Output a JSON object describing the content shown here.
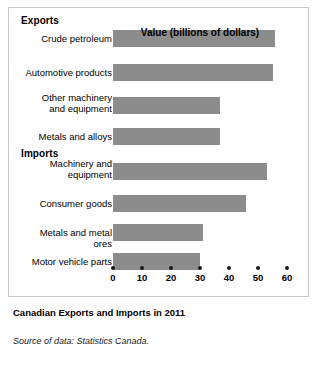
{
  "chart_data": {
    "type": "bar",
    "orientation": "horizontal",
    "title": "Canadian Exports and Imports in 2011",
    "xlabel": "Value (billions of dollars)",
    "ylabel": "",
    "xlim": [
      0,
      60
    ],
    "xticks": [
      0,
      10,
      20,
      30,
      40,
      50,
      60
    ],
    "xtick_labels": [
      "0",
      "10",
      "20",
      "30",
      "40",
      "50",
      "60"
    ],
    "grid": false,
    "legend": false,
    "bar_color": "#8c8c8c",
    "groups": [
      {
        "name": "Exports",
        "categories": [
          "Crude petroleum",
          "Automotive products",
          "Other machinery\nand equipment",
          "Metals and alloys"
        ],
        "values": [
          56,
          55,
          37,
          37
        ]
      },
      {
        "name": "Imports",
        "categories": [
          "Machinery and\nequipment",
          "Consumer goods",
          "Metals and metal ores",
          "Motor vehicle parts"
        ],
        "values": [
          53,
          46,
          31,
          30
        ]
      }
    ],
    "categories": [
      "Crude petroleum",
      "Automotive products",
      "Other machinery and equipment",
      "Metals and alloys",
      "Machinery and equipment",
      "Consumer goods",
      "Metals and metal ores",
      "Motor vehicle parts"
    ],
    "values": [
      56,
      55,
      37,
      37,
      53,
      46,
      31,
      30
    ],
    "source": "Source of data: Statistics Canada."
  },
  "figure": {
    "caption": "Canadian Exports and Imports in 2011",
    "source": "Source of data: Statistics Canada."
  }
}
